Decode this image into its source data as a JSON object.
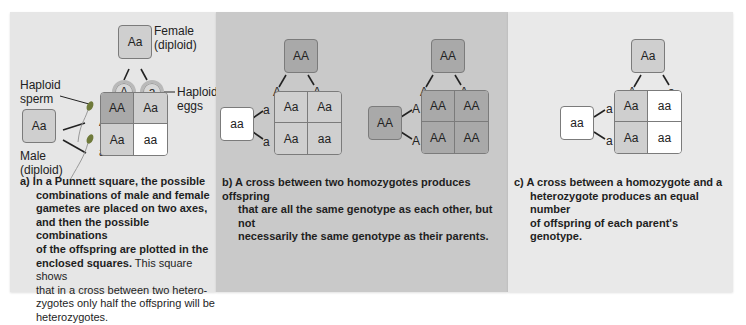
{
  "panels": {
    "a": {
      "female_parent": {
        "genotype": "Aa",
        "label_line1": "Female",
        "label_line2": "(diploid)"
      },
      "male_parent": {
        "genotype": "Aa",
        "label_line1": "Male",
        "label_line2": "(diploid)"
      },
      "eggs": {
        "alleles": [
          "A",
          "a"
        ],
        "label_line1": "Haploid",
        "label_line2": "eggs"
      },
      "sperm": {
        "alleles": [
          "A",
          "a"
        ],
        "label_line1": "Haploid",
        "label_line2": "sperm"
      },
      "grid": [
        [
          "AA",
          "Aa"
        ],
        [
          "Aa",
          "aa"
        ]
      ],
      "caption": {
        "letter": "a)",
        "bold_lines": [
          "In a Punnett square, the possible",
          "combinations of male and female",
          "gametes are placed on two axes,",
          "and then the possible combinations",
          "of the offspring are plotted in the"
        ],
        "bold_tail": "enclosed squares.",
        "normal_head": " This square shows",
        "normal_lines": [
          "that in a cross between two hetero-",
          "zygotes only half the offspring will be",
          "heterozygotes."
        ]
      }
    },
    "b": {
      "cross1": {
        "top_parent": "AA",
        "top_alleles": [
          "A",
          "A"
        ],
        "left_parent": "aa",
        "left_alleles": [
          "a",
          "a"
        ],
        "grid": [
          [
            "Aa",
            "Aa"
          ],
          [
            "Aa",
            "aa"
          ]
        ]
      },
      "cross2": {
        "top_parent": "AA",
        "top_alleles": [
          "A",
          "A"
        ],
        "left_parent": "AA",
        "left_alleles": [
          "A",
          "A"
        ],
        "grid": [
          [
            "AA",
            "AA"
          ],
          [
            "AA",
            "AA"
          ]
        ]
      },
      "caption": {
        "letter": "b)",
        "lines": [
          "A cross between two homozygotes produces offspring",
          "that are all the same genotype as each other, but not",
          "necessarily the same genotype as their parents."
        ]
      }
    },
    "c": {
      "top_parent": "Aa",
      "top_alleles": [
        "A",
        "a"
      ],
      "left_parent": "aa",
      "left_alleles": [
        "a",
        "a"
      ],
      "grid": [
        [
          "Aa",
          "aa"
        ],
        [
          "Aa",
          "aa"
        ]
      ],
      "caption": {
        "letter": "c)",
        "lines": [
          "A cross between a homozygote and a",
          "heterozygote produces an equal number",
          "of offspring of each parent's genotype."
        ]
      }
    }
  },
  "colors": {
    "panel_a_bg": "#e6e6e6",
    "panel_b_bg": "#c9c9c9",
    "panel_c_bg": "#e9e9e9",
    "homozygous_dominant": "#a9a9a9",
    "heterozygous": "#cfcfcf",
    "homozygous_recessive": "#ffffff"
  }
}
